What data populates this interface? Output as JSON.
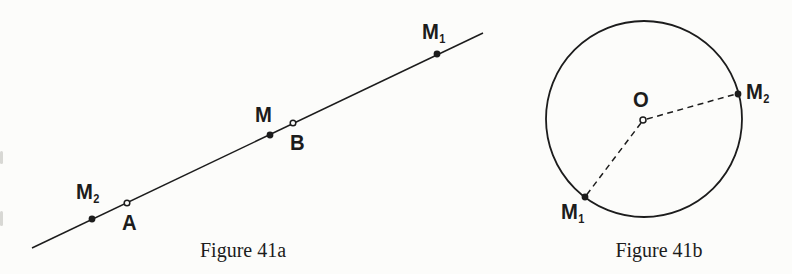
{
  "colors": {
    "ink": "#1c1c1c",
    "paper": "#fcfcfa"
  },
  "fig41a": {
    "caption": "Figure 41a",
    "points": {
      "m2": {
        "main": "M",
        "sub": "2"
      },
      "a": {
        "main": "A"
      },
      "m": {
        "main": "M"
      },
      "b": {
        "main": "B"
      },
      "m1": {
        "main": "M",
        "sub": "1"
      }
    }
  },
  "fig41b": {
    "caption": "Figure 41b",
    "points": {
      "o": {
        "main": "O"
      },
      "m2": {
        "main": "M",
        "sub": "2"
      },
      "m1": {
        "main": "M",
        "sub": "1"
      }
    }
  }
}
